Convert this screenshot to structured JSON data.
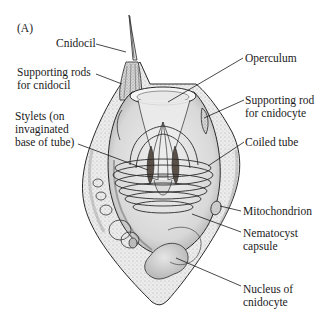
{
  "figure": {
    "panel_label": "(A)",
    "colors": {
      "ink": "#1a1a1a",
      "cell_fill": "#e4e4e4",
      "capsule_fill": "#d4d4d4",
      "stylet_fill": "#5a5048",
      "background": "#ffffff"
    }
  },
  "labels": {
    "cnidocil": "Cnidocil",
    "supporting_rods_cnidocil": "Supporting rods\nfor cnidocil",
    "stylets": "Stylets (on\ninvaginated\nbase of tube)",
    "operculum": "Operculum",
    "supporting_rod_cnidocyte": "Supporting rod\nfor cnidocyte",
    "coiled_tube": "Coiled tube",
    "mitochondrion": "Mitochondrion",
    "nematocyst_capsule": "Nematocyst\ncapsule",
    "nucleus": "Nucleus of\ncnidocyte"
  }
}
